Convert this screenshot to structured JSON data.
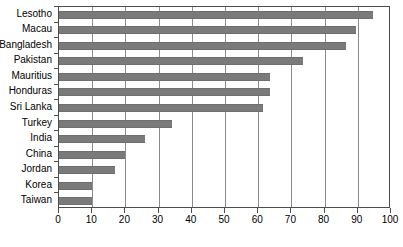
{
  "chart_data": {
    "type": "bar",
    "orientation": "horizontal",
    "title": "",
    "subtitle": "",
    "xlabel": "",
    "ylabel": "",
    "xlim": [
      0,
      100
    ],
    "xticks": [
      0,
      10,
      20,
      30,
      40,
      50,
      60,
      70,
      80,
      90,
      100
    ],
    "grid": "vertical",
    "legend": null,
    "bar_color": "#7a7a7a",
    "categories": [
      "Lesotho",
      "Macau",
      "Bangladesh",
      "Pakistan",
      "Mauritius",
      "Honduras",
      "Sri Lanka",
      "Turkey",
      "India",
      "China",
      "Jordan",
      "Korea",
      "Taiwan"
    ],
    "values": [
      94.5,
      89.5,
      86.5,
      73.5,
      63.5,
      63.5,
      61.5,
      34,
      26,
      20,
      17,
      10,
      10
    ]
  }
}
